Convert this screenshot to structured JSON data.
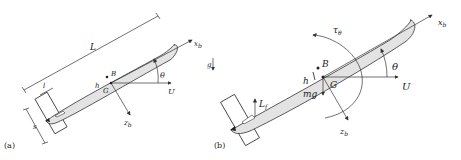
{
  "colors": {
    "body_fill": "#e3e3e3",
    "stroke": "#333333",
    "background": "#ffffff"
  },
  "panel_a": {
    "tag": "(a)",
    "labels": {
      "L": "L",
      "l": "l",
      "s": "s",
      "B": "B",
      "G": "G",
      "h": "h",
      "theta": "θ",
      "U": "U",
      "xb": "x",
      "xb_sub": "b",
      "zb": "z",
      "zb_sub": "b",
      "g": "g"
    }
  },
  "panel_b": {
    "tag": "(b)",
    "labels": {
      "tau": "τ",
      "tau_sub": "θ",
      "B": "B",
      "G": "G",
      "h": "h",
      "mg": "mg",
      "Lf": "L",
      "Lf_sub": "f",
      "theta": "θ",
      "U": "U",
      "xb": "x",
      "xb_sub": "b",
      "zb": "z",
      "zb_sub": "b"
    }
  }
}
